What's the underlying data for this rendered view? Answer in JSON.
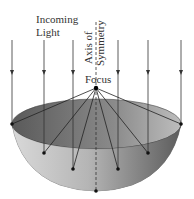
{
  "diagram": {
    "labels": {
      "incoming_line1": "Incoming",
      "incoming_line2": "Light",
      "axis_line1": "Axis of",
      "axis_line2": "Symmetry",
      "focus": "Focus"
    },
    "colors": {
      "ray": "#333333",
      "bowl_inner_dark": "#6e6e6e",
      "bowl_outer_light": "#c8c8c8",
      "bowl_outer_dark": "#7a7a7a"
    },
    "focus_point": [
      96,
      88
    ],
    "vertex_point": [
      96,
      191
    ],
    "rays": [
      {
        "x": 12,
        "reflect_y": 124
      },
      {
        "x": 44,
        "reflect_y": 153
      },
      {
        "x": 73,
        "reflect_y": 169
      },
      {
        "x": 118,
        "reflect_y": 169
      },
      {
        "x": 148,
        "reflect_y": 153
      },
      {
        "x": 181,
        "reflect_y": 124
      }
    ]
  }
}
